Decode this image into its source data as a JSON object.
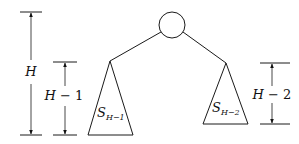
{
  "diagram": {
    "type": "tree-height-recurrence",
    "root": {
      "shape": "circle"
    },
    "subtrees": [
      {
        "name_base": "S",
        "subscript": "H−1",
        "position": "left"
      },
      {
        "name_base": "S",
        "subscript": "H−2",
        "position": "right"
      }
    ],
    "measures": [
      {
        "label_var": "H",
        "label_rest": "",
        "spans": "whole tree"
      },
      {
        "label_var": "H",
        "label_rest": " − 1",
        "spans": "left subtree"
      },
      {
        "label_var": "H",
        "label_rest": " − 2",
        "spans": "right subtree"
      }
    ],
    "colors": {
      "stroke": "#1a1a1a",
      "background": "#ffffff"
    }
  }
}
